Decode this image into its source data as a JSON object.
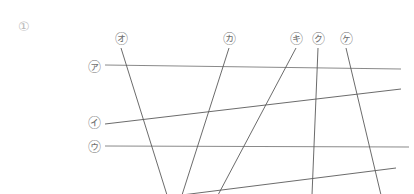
{
  "figure": {
    "number_label": "①",
    "number_pos": {
      "x": 18,
      "y": 20
    },
    "width": 414,
    "height": 194,
    "background": "#ffffff",
    "horizontal_line_color": "#8a8a8a",
    "diagonal_line_color": "#5a5a5a",
    "label_color": "#6f6f6f",
    "number_color": "#b9b9b9",
    "line_width": 1
  },
  "labels": [
    {
      "id": "a",
      "text": "㋐",
      "name": "label-a",
      "x": 94,
      "y": 66,
      "interactable": "false"
    },
    {
      "id": "i",
      "text": "㋑",
      "name": "label-i",
      "x": 94,
      "y": 122,
      "interactable": "false"
    },
    {
      "id": "u",
      "text": "㋒",
      "name": "label-u",
      "x": 94,
      "y": 146,
      "interactable": "false"
    },
    {
      "id": "o",
      "text": "㋔",
      "name": "label-o",
      "x": 121,
      "y": 38,
      "interactable": "false"
    },
    {
      "id": "ka",
      "text": "㋕",
      "name": "label-ka",
      "x": 229,
      "y": 38,
      "interactable": "false"
    },
    {
      "id": "ki",
      "text": "㋖",
      "name": "label-ki",
      "x": 296,
      "y": 38,
      "interactable": "false"
    },
    {
      "id": "ku",
      "text": "㋗",
      "name": "label-ku",
      "x": 318,
      "y": 38,
      "interactable": "false"
    },
    {
      "id": "ke",
      "text": "㋘",
      "name": "label-ke",
      "x": 346,
      "y": 38,
      "interactable": "false"
    }
  ],
  "lines": [
    {
      "id": "line-a",
      "name": "line-a",
      "kind": "horizontal",
      "x1": 105,
      "y1": 65,
      "x2": 401,
      "y2": 69,
      "color": "#8a8a8a",
      "width": 1.1
    },
    {
      "id": "line-i",
      "name": "line-i",
      "kind": "horizontal",
      "x1": 105,
      "y1": 124,
      "x2": 401,
      "y2": 89,
      "color": "#5a5a5a",
      "width": 0.9
    },
    {
      "id": "line-u",
      "name": "line-u",
      "kind": "horizontal",
      "x1": 105,
      "y1": 146,
      "x2": 409,
      "y2": 147,
      "color": "#8a8a8a",
      "width": 1.1
    },
    {
      "id": "line-e",
      "name": "line-e",
      "kind": "horizontal",
      "x1": 182,
      "y1": 195,
      "x2": 396,
      "y2": 168,
      "color": "#5a5a5a",
      "width": 0.9
    },
    {
      "id": "line-o",
      "name": "line-o",
      "kind": "diagonal",
      "x1": 121,
      "y1": 48,
      "x2": 167,
      "y2": 195,
      "color": "#5a5a5a",
      "width": 0.9
    },
    {
      "id": "line-ka",
      "name": "line-ka",
      "kind": "diagonal",
      "x1": 229,
      "y1": 48,
      "x2": 182,
      "y2": 195,
      "color": "#5a5a5a",
      "width": 0.9
    },
    {
      "id": "line-ki",
      "name": "line-ki",
      "kind": "diagonal",
      "x1": 296,
      "y1": 48,
      "x2": 218,
      "y2": 195,
      "color": "#5a5a5a",
      "width": 0.9
    },
    {
      "id": "line-ku",
      "name": "line-ku",
      "kind": "diagonal",
      "x1": 318,
      "y1": 48,
      "x2": 312,
      "y2": 195,
      "color": "#5a5a5a",
      "width": 0.9
    },
    {
      "id": "line-ke",
      "name": "line-ke",
      "kind": "diagonal",
      "x1": 346,
      "y1": 48,
      "x2": 381,
      "y2": 195,
      "color": "#5a5a5a",
      "width": 0.9
    }
  ]
}
